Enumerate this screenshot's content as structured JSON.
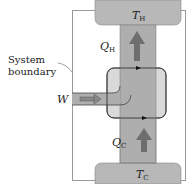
{
  "diagram": {
    "type": "heat-pump-energy-flow",
    "labels": {
      "hot_reservoir": "T",
      "hot_reservoir_sub": "H",
      "cold_reservoir": "T",
      "cold_reservoir_sub": "C",
      "heat_hot": "Q",
      "heat_hot_sub": "H",
      "heat_cold": "Q",
      "heat_cold_sub": "C",
      "work": "W",
      "boundary_line1": "System",
      "boundary_line2": "boundary"
    },
    "colors": {
      "reservoir_fill": "#b8b8b8",
      "flow_band_fill": "#aeaeae",
      "engine_fill": "#d9d9d9",
      "arrow_fill": "#6e6e6e",
      "frame_stroke": "#9a9a9a",
      "line_stroke": "#333333",
      "background": "#ffffff"
    }
  }
}
